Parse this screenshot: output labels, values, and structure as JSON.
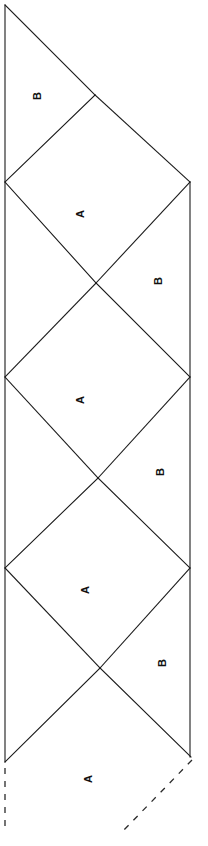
{
  "diagram": {
    "type": "geometric-line-diagram",
    "canvas": {
      "width": 208,
      "height": 846
    },
    "style": {
      "background_color": "#ffffff",
      "line_color": "#1a1a1a",
      "dashed_line_color": "#2a2a2a",
      "label_color": "#111111",
      "line_width": 1.1,
      "dash_pattern": "6 7"
    },
    "geometry": {
      "left_edge_x": 5,
      "right_edge_x": 190,
      "left_vertices_y": [
        182,
        377,
        568,
        762
      ],
      "right_vertices_y": [
        182,
        377,
        568,
        757
      ],
      "notch_vertices": [
        {
          "x": 95,
          "y": 95
        },
        {
          "x": 96,
          "y": 283
        },
        {
          "x": 98,
          "y": 478
        },
        {
          "x": 100,
          "y": 668
        }
      ],
      "top_apex": {
        "x": 5,
        "y": 5
      },
      "repeat_period_px": 190
    },
    "edges": {
      "left_solid": {
        "x1": 5,
        "y1": 5,
        "x2": 5,
        "y2": 762
      },
      "right_solid": {
        "x1": 190,
        "y1": 182,
        "x2": 190,
        "y2": 757
      },
      "left_dashed": {
        "x1": 5,
        "y1": 766,
        "x2": 5,
        "y2": 832
      },
      "right_dashed": {
        "x1": 192,
        "y1": 760,
        "x2": 122,
        "y2": 832
      }
    },
    "regions": [
      {
        "id": "b1",
        "label": "B",
        "label_x": 37,
        "label_y": 96,
        "rotation": -90
      },
      {
        "id": "a1",
        "label": "A",
        "label_x": 80,
        "label_y": 214,
        "rotation": -90
      },
      {
        "id": "b2",
        "label": "B",
        "label_x": 158,
        "label_y": 281,
        "rotation": -90
      },
      {
        "id": "a2",
        "label": "A",
        "label_x": 80,
        "label_y": 400,
        "rotation": -90
      },
      {
        "id": "b3",
        "label": "B",
        "label_x": 160,
        "label_y": 472,
        "rotation": -90
      },
      {
        "id": "a3",
        "label": "A",
        "label_x": 85,
        "label_y": 590,
        "rotation": -90
      },
      {
        "id": "b4",
        "label": "B",
        "label_x": 162,
        "label_y": 663,
        "rotation": -90
      },
      {
        "id": "a4",
        "label": "A",
        "label_x": 88,
        "label_y": 779,
        "rotation": -90
      }
    ],
    "fold_lines": [
      {
        "id": "f1",
        "x1": 5,
        "y1": 5,
        "x2": 95,
        "y2": 95
      },
      {
        "id": "f2",
        "x1": 95,
        "y1": 95,
        "x2": 5,
        "y2": 182
      },
      {
        "id": "f3",
        "x1": 95,
        "y1": 95,
        "x2": 190,
        "y2": 182
      },
      {
        "id": "f4",
        "x1": 5,
        "y1": 182,
        "x2": 96,
        "y2": 283
      },
      {
        "id": "f5",
        "x1": 96,
        "y1": 283,
        "x2": 190,
        "y2": 182
      },
      {
        "id": "f6",
        "x1": 96,
        "y1": 283,
        "x2": 190,
        "y2": 377
      },
      {
        "id": "f7",
        "x1": 96,
        "y1": 283,
        "x2": 5,
        "y2": 377
      },
      {
        "id": "f8",
        "x1": 5,
        "y1": 377,
        "x2": 98,
        "y2": 478
      },
      {
        "id": "f9",
        "x1": 98,
        "y1": 478,
        "x2": 190,
        "y2": 377
      },
      {
        "id": "f10",
        "x1": 98,
        "y1": 478,
        "x2": 190,
        "y2": 568
      },
      {
        "id": "f11",
        "x1": 98,
        "y1": 478,
        "x2": 5,
        "y2": 568
      },
      {
        "id": "f12",
        "x1": 5,
        "y1": 568,
        "x2": 100,
        "y2": 668
      },
      {
        "id": "f13",
        "x1": 100,
        "y1": 668,
        "x2": 190,
        "y2": 568
      },
      {
        "id": "f14",
        "x1": 100,
        "y1": 668,
        "x2": 191,
        "y2": 757
      },
      {
        "id": "f15",
        "x1": 100,
        "y1": 668,
        "x2": 5,
        "y2": 762
      }
    ]
  }
}
